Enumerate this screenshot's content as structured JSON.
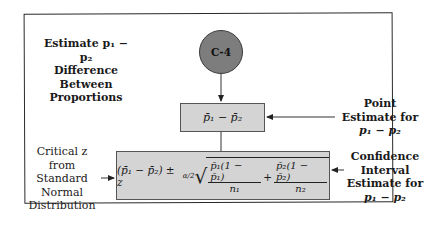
{
  "diagram": {
    "node_id": "C-4",
    "title_lines": [
      "Estimate p₁ − p₂",
      "Difference Between",
      "Proportions"
    ],
    "point_estimate_box": "p̄₁ − p̄₂",
    "formula": {
      "lead": "(p̄₁ − p̄₂) ± z",
      "z_sub": "α/2",
      "term1_num": "p̄₁(1 − p̄₁)",
      "term1_den": "n₁",
      "plus": "+",
      "term2_num": "p̄₂(1 − p̄₂)",
      "term2_den": "n₂"
    },
    "labels": {
      "point_estimate": [
        "Point",
        "Estimate for",
        "p₁ − p₂"
      ],
      "critical_z": [
        "Critical z",
        "from Standard",
        "Normal",
        "Distribution"
      ],
      "confidence_interval": [
        "Confidence",
        "Interval",
        "Estimate for",
        "p₁ − p₂"
      ]
    },
    "colors": {
      "node_fill": "#7d7d7d",
      "box_fill": "#d4d4d4",
      "frame": "#2a2a2a"
    }
  }
}
